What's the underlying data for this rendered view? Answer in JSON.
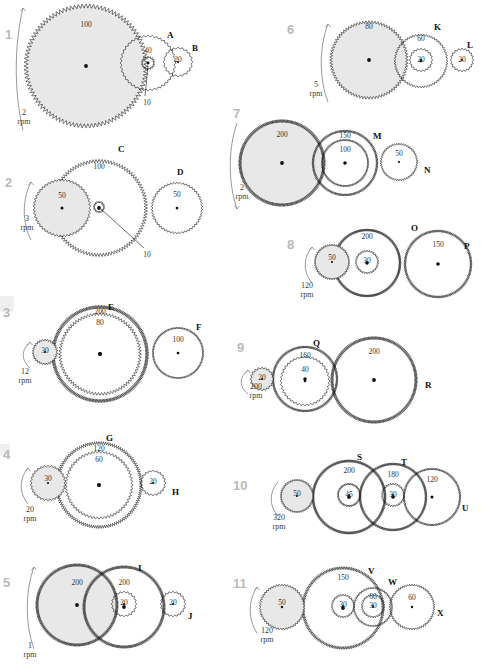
{
  "page": {
    "kind": "gear-train-exercise-sheet",
    "width": 481,
    "height": 664,
    "background": "#ffffff",
    "ink": "#111111",
    "shaded_gear_fill": "#e8e8e8",
    "number_color": "#b9b9b9"
  },
  "problems": [
    {
      "id": "p1",
      "number": "1",
      "num_pos": [
        5,
        27
      ],
      "input": {
        "rpm": "2",
        "unit": "rpm",
        "pos": [
          22,
          108
        ],
        "arrow": "ccw"
      },
      "gears": [
        {
          "name": "driver-1",
          "label": "",
          "teeth": "100",
          "cx": 86,
          "cy": 66,
          "r": 60,
          "shaded": true,
          "teeth_pos": [
            86,
            20
          ]
        },
        {
          "name": "gear-A",
          "label": "A",
          "label_pos": [
            167,
            30
          ],
          "teeth": "40",
          "cx": 148,
          "cy": 63,
          "r": 27,
          "shaded": false,
          "teeth_pos": [
            148,
            46
          ]
        },
        {
          "name": "gear-A-pinion",
          "label": "",
          "teeth": "10",
          "cx": 148,
          "cy": 63,
          "r": 6,
          "shaded": false,
          "teeth_pos": [
            147,
            98
          ],
          "leader": true
        },
        {
          "name": "gear-B",
          "label": "B",
          "label_pos": [
            192,
            43
          ],
          "teeth": "20",
          "cx": 178,
          "cy": 62,
          "r": 14,
          "shaded": false,
          "teeth_pos": [
            178,
            55
          ]
        }
      ]
    },
    {
      "id": "p2",
      "number": "2",
      "num_pos": [
        5,
        175
      ],
      "input": {
        "rpm": "3",
        "unit": "rpm",
        "pos": [
          25,
          214
        ],
        "arrow": "ccw"
      },
      "gears": [
        {
          "name": "gear-C",
          "label": "C",
          "label_pos": [
            118,
            144
          ],
          "teeth": "100",
          "cx": 99,
          "cy": 208,
          "r": 47,
          "shaded": false,
          "teeth_pos": [
            99,
            162
          ]
        },
        {
          "name": "driver-2",
          "label": "",
          "teeth": "50",
          "cx": 62,
          "cy": 208,
          "r": 28,
          "shaded": true,
          "teeth_pos": [
            62,
            191
          ]
        },
        {
          "name": "gear-C-pinion",
          "label": "",
          "teeth": "10",
          "cx": 99,
          "cy": 207,
          "r": 5,
          "shaded": false,
          "teeth_pos": [
            147,
            250
          ],
          "leader": true
        },
        {
          "name": "gear-D",
          "label": "D",
          "label_pos": [
            177,
            167
          ],
          "teeth": "50",
          "cx": 177,
          "cy": 208,
          "r": 25,
          "shaded": false,
          "teeth_pos": [
            177,
            190
          ]
        }
      ]
    },
    {
      "id": "p3",
      "number": "3",
      "num_pos": [
        3,
        305
      ],
      "input": {
        "rpm": "12",
        "unit": "rpm",
        "pos": [
          23,
          367
        ],
        "arrow": "ccw"
      },
      "gears": [
        {
          "name": "gear-E-outer",
          "label": "E",
          "label_pos": [
            108,
            302
          ],
          "teeth": "200",
          "cx": 100,
          "cy": 354,
          "r": 47,
          "shaded": false,
          "teeth_pos": [
            100,
            307
          ]
        },
        {
          "name": "gear-E-inner",
          "label": "",
          "teeth": "80",
          "cx": 100,
          "cy": 354,
          "r": 40,
          "shaded": false,
          "teeth_pos": [
            100,
            318
          ]
        },
        {
          "name": "driver-3",
          "label": "",
          "teeth": "30",
          "cx": 45,
          "cy": 352,
          "r": 12,
          "shaded": true,
          "teeth_pos": [
            45,
            346
          ]
        },
        {
          "name": "gear-F",
          "label": "F",
          "label_pos": [
            196,
            322
          ],
          "teeth": "100",
          "cx": 178,
          "cy": 353,
          "r": 25,
          "shaded": false,
          "teeth_pos": [
            178,
            335
          ]
        }
      ]
    },
    {
      "id": "p4",
      "number": "4",
      "num_pos": [
        3,
        447
      ],
      "input": {
        "rpm": "20",
        "unit": "rpm",
        "pos": [
          28,
          505
        ],
        "arrow": "ccw"
      },
      "gears": [
        {
          "name": "gear-G-outer",
          "label": "G",
          "label_pos": [
            106,
            433
          ],
          "teeth": "120",
          "cx": 99,
          "cy": 485,
          "r": 42,
          "shaded": false,
          "teeth_pos": [
            99,
            444
          ]
        },
        {
          "name": "gear-G-inner",
          "label": "",
          "teeth": "60",
          "cx": 99,
          "cy": 485,
          "r": 33,
          "shaded": false,
          "teeth_pos": [
            99,
            455
          ]
        },
        {
          "name": "driver-4",
          "label": "",
          "teeth": "30",
          "cx": 48,
          "cy": 483,
          "r": 17,
          "shaded": true,
          "teeth_pos": [
            48,
            474
          ]
        },
        {
          "name": "gear-H",
          "label": "H",
          "label_pos": [
            172,
            487
          ],
          "teeth": "20",
          "cx": 153,
          "cy": 483,
          "r": 12,
          "shaded": false,
          "teeth_pos": [
            153,
            477
          ]
        }
      ]
    },
    {
      "id": "p5",
      "number": "5",
      "num_pos": [
        3,
        575
      ],
      "input": {
        "rpm": "1",
        "unit": "rpm",
        "pos": [
          28,
          641
        ],
        "arrow": "ccw"
      },
      "gears": [
        {
          "name": "driver-5",
          "label": "",
          "teeth": "200",
          "cx": 77,
          "cy": 605,
          "r": 40,
          "shaded": true,
          "teeth_pos": [
            77,
            578
          ]
        },
        {
          "name": "gear-I",
          "label": "I",
          "label_pos": [
            138,
            563
          ],
          "teeth": "200",
          "cx": 124,
          "cy": 607,
          "r": 40,
          "shaded": false,
          "teeth_pos": [
            124,
            578
          ]
        },
        {
          "name": "gear-I-pinion",
          "label": "",
          "teeth": "20",
          "cx": 124,
          "cy": 604,
          "r": 12,
          "shaded": false,
          "teeth_pos": [
            124,
            598
          ]
        },
        {
          "name": "gear-J",
          "label": "J",
          "label_pos": [
            188,
            611
          ],
          "teeth": "20",
          "cx": 173,
          "cy": 604,
          "r": 12,
          "shaded": false,
          "teeth_pos": [
            173,
            598
          ]
        }
      ]
    },
    {
      "id": "p6",
      "number": "6",
      "num_pos": [
        287,
        22
      ],
      "input": {
        "rpm": "5",
        "unit": "rpm",
        "pos": [
          314,
          80
        ],
        "arrow": "ccw"
      },
      "gears": [
        {
          "name": "driver-6",
          "label": "",
          "teeth": "80",
          "cx": 369,
          "cy": 60,
          "r": 38,
          "shaded": true,
          "teeth_pos": [
            369,
            22
          ]
        },
        {
          "name": "gear-K",
          "label": "K",
          "label_pos": [
            434,
            22
          ],
          "teeth": "60",
          "cx": 421,
          "cy": 61,
          "r": 26,
          "shaded": false,
          "teeth_pos": [
            421,
            34
          ]
        },
        {
          "name": "gear-K-pinion",
          "label": "",
          "teeth": "20",
          "cx": 421,
          "cy": 60,
          "r": 11,
          "shaded": false,
          "teeth_pos": [
            421,
            55
          ]
        },
        {
          "name": "gear-L",
          "label": "L",
          "label_pos": [
            467,
            40
          ],
          "teeth": "20",
          "cx": 462,
          "cy": 60,
          "r": 11,
          "shaded": false,
          "teeth_pos": [
            462,
            55
          ]
        }
      ]
    },
    {
      "id": "p7",
      "number": "7",
      "num_pos": [
        233,
        106
      ],
      "input": {
        "rpm": "2",
        "unit": "rpm",
        "pos": [
          240,
          183
        ],
        "arrow": "cw"
      },
      "gears": [
        {
          "name": "driver-7",
          "label": "",
          "teeth": "200",
          "cx": 282,
          "cy": 163,
          "r": 42,
          "shaded": true,
          "teeth_pos": [
            282,
            130
          ]
        },
        {
          "name": "gear-M-outer",
          "label": "M",
          "label_pos": [
            373,
            131
          ],
          "teeth": "150",
          "cx": 345,
          "cy": 163,
          "r": 32,
          "shaded": false,
          "teeth_pos": [
            345,
            131
          ]
        },
        {
          "name": "gear-M-inner",
          "label": "",
          "teeth": "100",
          "cx": 345,
          "cy": 163,
          "r": 23,
          "shaded": false,
          "teeth_pos": [
            345,
            145
          ]
        },
        {
          "name": "gear-N",
          "label": "N",
          "label_pos": [
            424,
            165
          ],
          "teeth": "50",
          "cx": 399,
          "cy": 162,
          "r": 18,
          "shaded": false,
          "teeth_pos": [
            399,
            149
          ]
        }
      ]
    },
    {
      "id": "p8",
      "number": "8",
      "num_pos": [
        287,
        237
      ],
      "input": {
        "rpm": "120",
        "unit": "rpm",
        "pos": [
          305,
          281
        ],
        "arrow": "ccw"
      },
      "gears": [
        {
          "name": "driver-8",
          "label": "",
          "teeth": "50",
          "cx": 332,
          "cy": 262,
          "r": 17,
          "shaded": true,
          "teeth_pos": [
            332,
            253
          ]
        },
        {
          "name": "gear-O",
          "label": "O",
          "label_pos": [
            411,
            223
          ],
          "teeth": "200",
          "cx": 367,
          "cy": 263,
          "r": 33,
          "shaded": false,
          "teeth_pos": [
            367,
            232
          ]
        },
        {
          "name": "gear-O-pinion",
          "label": "",
          "teeth": "30",
          "cx": 367,
          "cy": 262,
          "r": 11,
          "shaded": false,
          "teeth_pos": [
            367,
            256
          ]
        },
        {
          "name": "gear-P",
          "label": "P",
          "label_pos": [
            464,
            241
          ],
          "teeth": "150",
          "cx": 438,
          "cy": 264,
          "r": 33,
          "shaded": false,
          "teeth_pos": [
            438,
            240
          ]
        }
      ]
    },
    {
      "id": "p9",
      "number": "9",
      "num_pos": [
        237,
        340
      ],
      "input": {
        "rpm": "200",
        "unit": "rpm",
        "pos": [
          254,
          382
        ],
        "arrow": "ccw"
      },
      "gears": [
        {
          "name": "driver-9",
          "label": "",
          "teeth": "20",
          "cx": 262,
          "cy": 379,
          "r": 11,
          "shaded": true,
          "teeth_pos": [
            262,
            373
          ]
        },
        {
          "name": "gear-Q-outer",
          "label": "Q",
          "label_pos": [
            313,
            338
          ],
          "teeth": "160",
          "cx": 305,
          "cy": 379,
          "r": 32,
          "shaded": false,
          "teeth_pos": [
            305,
            351
          ]
        },
        {
          "name": "gear-Q-inner",
          "label": "",
          "teeth": "40",
          "cx": 305,
          "cy": 381,
          "r": 24,
          "shaded": false,
          "teeth_pos": [
            305,
            365
          ]
        },
        {
          "name": "gear-R",
          "label": "R",
          "label_pos": [
            425,
            380
          ],
          "teeth": "200",
          "cx": 374,
          "cy": 380,
          "r": 42,
          "shaded": false,
          "teeth_pos": [
            374,
            347
          ]
        }
      ]
    },
    {
      "id": "p10",
      "number": "10",
      "num_pos": [
        233,
        478
      ],
      "input": {
        "rpm": "320",
        "unit": "rpm",
        "pos": [
          277,
          513
        ],
        "arrow": "cw"
      },
      "gears": [
        {
          "name": "driver-10",
          "label": "",
          "teeth": "50",
          "cx": 297,
          "cy": 496,
          "r": 16,
          "shaded": true,
          "teeth_pos": [
            297,
            489
          ]
        },
        {
          "name": "gear-S-outer",
          "label": "S",
          "label_pos": [
            357,
            452
          ],
          "teeth": "200",
          "cx": 349,
          "cy": 497,
          "r": 36,
          "shaded": false,
          "teeth_pos": [
            349,
            466
          ]
        },
        {
          "name": "gear-S-pinion",
          "label": "",
          "teeth": "45",
          "cx": 349,
          "cy": 495,
          "r": 11,
          "shaded": false,
          "teeth_pos": [
            349,
            490
          ]
        },
        {
          "name": "gear-T-outer",
          "label": "T",
          "label_pos": [
            401,
            457
          ],
          "teeth": "180",
          "cx": 393,
          "cy": 497,
          "r": 33,
          "shaded": false,
          "teeth_pos": [
            393,
            470
          ]
        },
        {
          "name": "gear-T-pinion",
          "label": "",
          "teeth": "30",
          "cx": 393,
          "cy": 495,
          "r": 11,
          "shaded": false,
          "teeth_pos": [
            393,
            490
          ]
        },
        {
          "name": "gear-U",
          "label": "U",
          "label_pos": [
            462,
            503
          ],
          "teeth": "120",
          "cx": 432,
          "cy": 497,
          "r": 28,
          "shaded": false,
          "teeth_pos": [
            432,
            475
          ]
        }
      ]
    },
    {
      "id": "p11",
      "number": "11",
      "num_pos": [
        233,
        576
      ],
      "input": {
        "rpm": "120",
        "unit": "rpm",
        "pos": [
          265,
          626
        ],
        "arrow": "ccw"
      },
      "gears": [
        {
          "name": "driver-11",
          "label": "",
          "teeth": "50",
          "cx": 282,
          "cy": 607,
          "r": 22,
          "shaded": true,
          "teeth_pos": [
            282,
            598
          ]
        },
        {
          "name": "gear-V",
          "label": "V",
          "label_pos": [
            368,
            566
          ],
          "teeth": "150",
          "cx": 343,
          "cy": 608,
          "r": 40,
          "shaded": false,
          "teeth_pos": [
            343,
            573
          ]
        },
        {
          "name": "gear-V-pinion",
          "label": "",
          "teeth": "30",
          "cx": 343,
          "cy": 606,
          "r": 11,
          "shaded": false,
          "teeth_pos": [
            343,
            600
          ]
        },
        {
          "name": "gear-W-outer",
          "label": "W",
          "label_pos": [
            388,
            577
          ],
          "teeth": "60",
          "cx": 373,
          "cy": 607,
          "r": 19,
          "shaded": false,
          "teeth_pos": [
            373,
            592
          ]
        },
        {
          "name": "gear-W-pinion",
          "label": "",
          "teeth": "30",
          "cx": 373,
          "cy": 606,
          "r": 11,
          "shaded": false,
          "teeth_pos": [
            373,
            601
          ]
        },
        {
          "name": "gear-X",
          "label": "X",
          "label_pos": [
            437,
            608
          ],
          "teeth": "60",
          "cx": 412,
          "cy": 607,
          "r": 22,
          "shaded": false,
          "teeth_pos": [
            412,
            593
          ]
        }
      ]
    }
  ],
  "leaders": [
    {
      "name": "leader-p1",
      "x1": 148,
      "y1": 66,
      "x2": 145,
      "y2": 96
    },
    {
      "name": "leader-p2",
      "x1": 101,
      "y1": 209,
      "x2": 144,
      "y2": 248
    }
  ],
  "smudges": [
    {
      "x": 0,
      "y": 296,
      "w": 14,
      "h": 16
    },
    {
      "x": 0,
      "y": 444,
      "w": 10,
      "h": 12
    }
  ]
}
